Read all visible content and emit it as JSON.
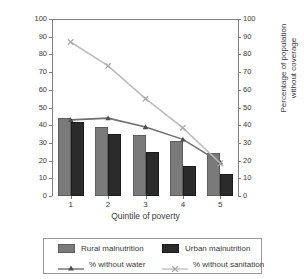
{
  "chart_data": {
    "type": "bar",
    "title": "",
    "categories": [
      "1",
      "2",
      "3",
      "4",
      "5"
    ],
    "xlabel": "Quintile of poverty",
    "ylabel": "Percentage of child malnutrition",
    "ylabel_right": "Percentage of population without coverage",
    "ylim": [
      0,
      100
    ],
    "ylim_right": [
      0,
      100
    ],
    "yticks": [
      0,
      10,
      20,
      30,
      40,
      50,
      60,
      70,
      80,
      90,
      100
    ],
    "yticks_right": [
      0,
      10,
      20,
      30,
      40,
      50,
      60,
      70,
      80,
      90,
      100
    ],
    "grid": false,
    "legend_position": "bottom",
    "series": [
      {
        "name": "Rural malnutrition",
        "type": "bar",
        "axis": "left",
        "color": "#7a7a7a",
        "values": [
          44,
          39,
          34.5,
          31,
          24.5
        ]
      },
      {
        "name": "Urban malnutrition",
        "type": "bar",
        "axis": "left",
        "color": "#2b2b2b",
        "values": [
          42,
          35,
          25,
          17,
          12.5
        ]
      },
      {
        "name": "% without water",
        "type": "line",
        "axis": "right",
        "color": "#6f6f6f",
        "marker": "triangle",
        "values": [
          43,
          44,
          39,
          32,
          19
        ]
      },
      {
        "name": "% without sanitation",
        "type": "line",
        "axis": "right",
        "color": "#bdbdbd",
        "marker": "x",
        "values": [
          87,
          73.5,
          55,
          38.5,
          18.5
        ]
      }
    ]
  },
  "axes": {
    "left_title_line1": "Percentage of child",
    "left_title_line2": "malnutrition",
    "right_title_line1": "Percentage of population",
    "right_title_line2": "without coverage",
    "x_title": "Quintile of poverty",
    "y_tick_labels": [
      "100",
      "90",
      "80",
      "70",
      "60",
      "50",
      "40",
      "30",
      "20",
      "10",
      "0"
    ],
    "y_tick_labels_right": [
      "100",
      "90",
      "80",
      "70",
      "60",
      "50",
      "40",
      "30",
      "20",
      "10",
      "0"
    ],
    "x_tick_labels": [
      "1",
      "2",
      "3",
      "4",
      "5"
    ]
  },
  "legend": {
    "rural_label": "Rural malnutrition",
    "urban_label": "Urban malnutrition",
    "water_label": "% without water",
    "sanitation_label": "% without sanitation"
  }
}
